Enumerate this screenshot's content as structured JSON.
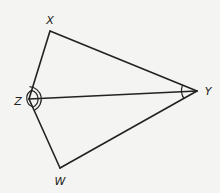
{
  "diagram": {
    "type": "kite-quadrilateral",
    "vertices": {
      "X": {
        "label": "X",
        "x": 50,
        "y": 31,
        "label_x": 50,
        "label_y": 20
      },
      "Y": {
        "label": "Y",
        "x": 197,
        "y": 91,
        "label_x": 208,
        "label_y": 91
      },
      "Z": {
        "label": "Z",
        "x": 29,
        "y": 99,
        "label_x": 18,
        "label_y": 101
      },
      "W": {
        "label": "W",
        "x": 60,
        "y": 168,
        "label_x": 60,
        "label_y": 181
      }
    },
    "segments": [
      "XY",
      "YW",
      "WZ",
      "ZX",
      "ZY"
    ],
    "angle_marks": [
      {
        "vertex": "Z",
        "arcs": 2,
        "description": "angle XZY congruent to angle WZY"
      },
      {
        "vertex": "Y",
        "arcs": 1,
        "description": "angle XYZ congruent to angle WYZ"
      }
    ],
    "colors": {
      "line": "#222222",
      "background": "#f4f4f2"
    }
  }
}
